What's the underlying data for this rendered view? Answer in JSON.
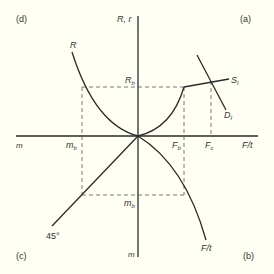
{
  "diagram": {
    "quadrant_labels": {
      "a": "(a)",
      "b": "(b)",
      "c": "(c)",
      "d": "(d)"
    },
    "axes": {
      "vertical_top": "R, r",
      "vertical_bottom": "m",
      "horizontal_left": "m",
      "horizontal_right": "F/t"
    },
    "curves": {
      "R": "R",
      "S": "S",
      "S_sub": "I",
      "D": "D",
      "D_sub": "I",
      "Ft": "F/t",
      "line45": "45°"
    },
    "markers": {
      "Rb": "R",
      "Rb_sub": "b",
      "Fb": "F",
      "Fb_sub": "b",
      "Fc": "F",
      "Fc_sub": "c",
      "mb_left": "m",
      "mb_left_sub": "b",
      "mb_bottom": "m",
      "mb_bottom_sub": "b"
    },
    "colors": {
      "line": "#2a2a2a",
      "dash": "#555555",
      "background": "#fffff4"
    }
  }
}
